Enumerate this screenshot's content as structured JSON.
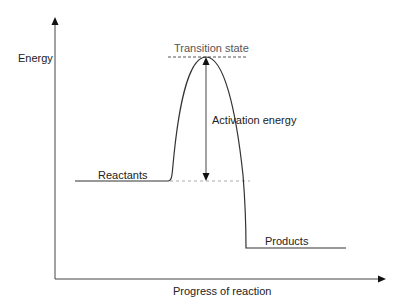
{
  "diagram": {
    "y_axis_label": "Energy",
    "x_axis_label": "Progress of reaction",
    "labels": {
      "transition_state": "Transition state",
      "activation_energy": "Activation energy",
      "reactants": "Reactants",
      "products": "Products"
    },
    "colors": {
      "line": "#333333",
      "dashed": "#999999"
    }
  }
}
